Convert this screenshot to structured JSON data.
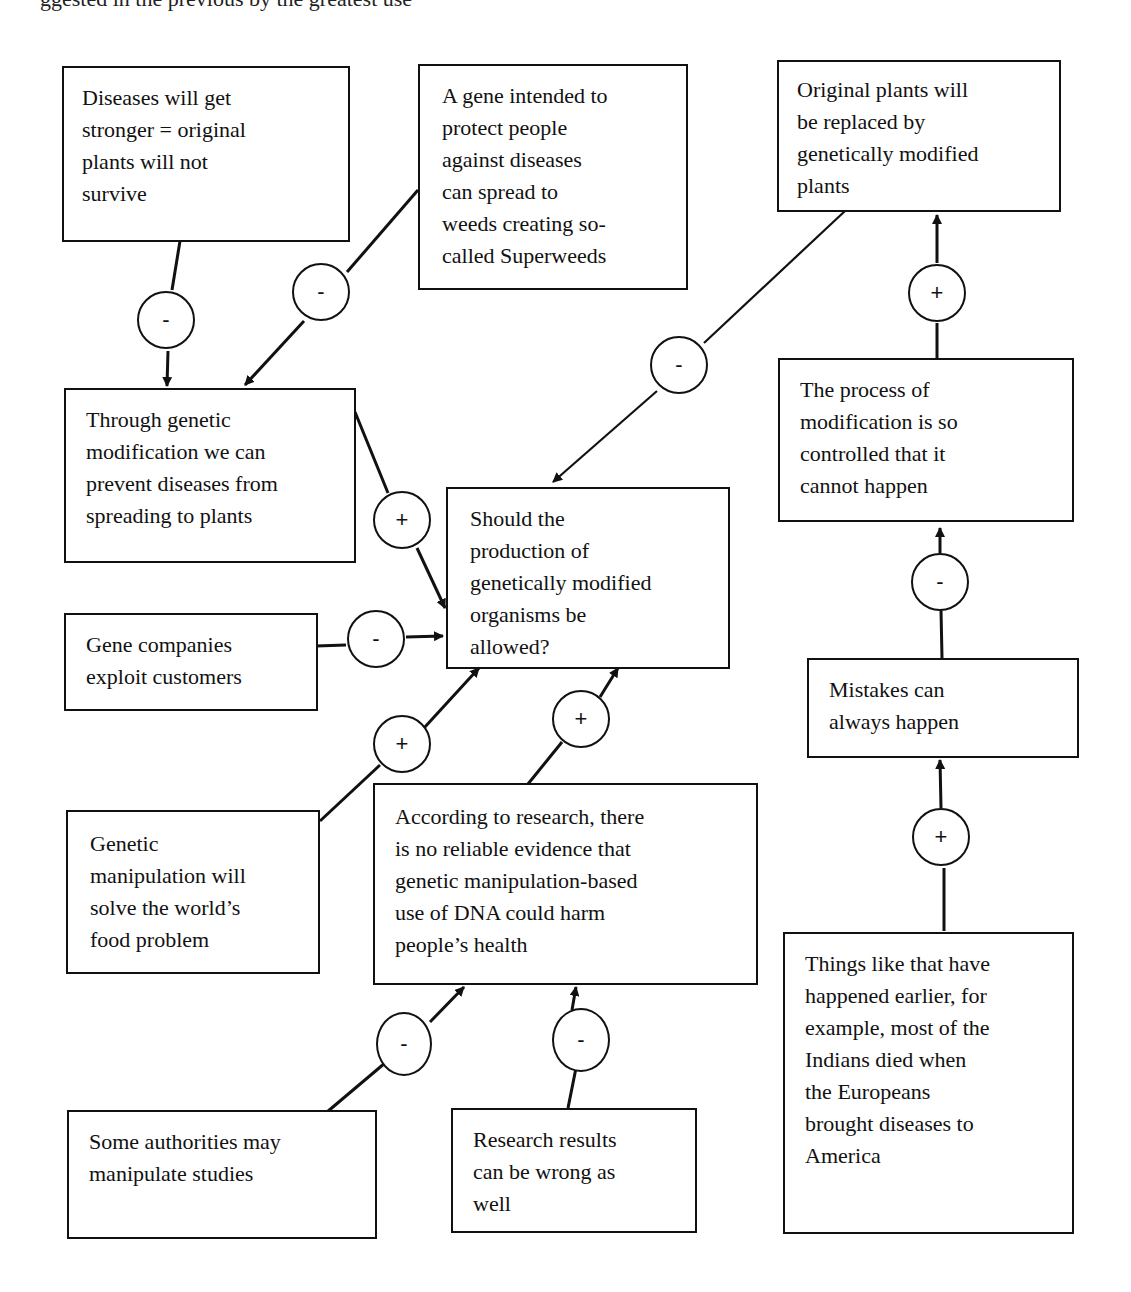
{
  "page": {
    "top_fragment": "ggested in the previous by the greatest use"
  },
  "central_question": {
    "text": "Should the\nproduction of\ngenetically modified\norganisms be\nallowed?"
  },
  "boxes": [
    {
      "id": "diseases-stronger",
      "text": "Diseases will get\nstronger  = original\nplants will not\nsurvive"
    },
    {
      "id": "superweeds",
      "text": "A gene intended to\nprotect people\nagainst diseases\ncan spread to\nweeds creating so-\ncalled Superweeds"
    },
    {
      "id": "original-replaced",
      "text": "Original plants will\nbe replaced by\ngenetically modified\nplants"
    },
    {
      "id": "prevent-diseases",
      "text": "Through genetic\nmodification we can\nprevent diseases from\nspreading to plants"
    },
    {
      "id": "process-controlled",
      "text": "The process of\nmodification is so\ncontrolled that it\ncannot happen"
    },
    {
      "id": "gene-companies",
      "text": "Gene companies\nexploit customers"
    },
    {
      "id": "mistakes",
      "text": "Mistakes can\nalways happen"
    },
    {
      "id": "food-problem",
      "text": "Genetic\nmanipulation will\nsolve the world’s\nfood problem"
    },
    {
      "id": "research-no-evidence",
      "text": "According to research, there\nis no reliable evidence that\ngenetic manipulation-based\nuse of DNA could harm\npeople’s health"
    },
    {
      "id": "history-europeans",
      "text": "Things like that have\nhappened earlier, for\nexample, most of the\nIndians died when\nthe Europeans\nbrought diseases to\nAmerica"
    },
    {
      "id": "authorities-manipulate",
      "text": "Some authorities may\nmanipulate studies"
    },
    {
      "id": "research-wrong",
      "text": "Research results\ncan be wrong as\nwell"
    }
  ],
  "links": [
    {
      "from": "diseases-stronger",
      "to": "prevent-diseases",
      "sign": "-"
    },
    {
      "from": "superweeds",
      "to": "prevent-diseases",
      "sign": "-"
    },
    {
      "from": "original-replaced",
      "to": "central-question",
      "sign": "-"
    },
    {
      "from": "process-controlled",
      "to": "original-replaced",
      "sign": "+"
    },
    {
      "from": "prevent-diseases",
      "to": "central-question",
      "sign": "+"
    },
    {
      "from": "gene-companies",
      "to": "central-question",
      "sign": "-"
    },
    {
      "from": "mistakes",
      "to": "process-controlled",
      "sign": "-"
    },
    {
      "from": "food-problem",
      "to": "central-question",
      "sign": "+"
    },
    {
      "from": "research-no-evidence",
      "to": "central-question",
      "sign": "+"
    },
    {
      "from": "history-europeans",
      "to": "mistakes",
      "sign": "+"
    },
    {
      "from": "authorities-manipulate",
      "to": "research-no-evidence",
      "sign": "-"
    },
    {
      "from": "research-wrong",
      "to": "research-no-evidence",
      "sign": "-"
    }
  ],
  "colors": {
    "line": "#111111",
    "background": "#ffffff"
  }
}
